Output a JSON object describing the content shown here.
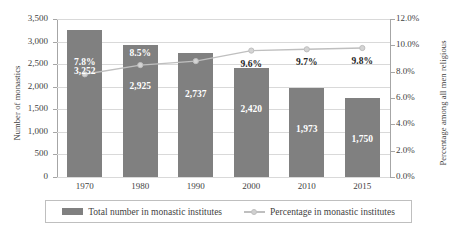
{
  "chart_data": {
    "type": "bar",
    "title": "",
    "subtitle": "",
    "categories": [
      "1970",
      "1980",
      "1990",
      "2000",
      "2010",
      "2015"
    ],
    "xlabel": "",
    "series": [
      {
        "name": "Total number in monastic institutes",
        "type": "bar",
        "axis": "left",
        "values": [
          3252,
          2925,
          2737,
          2420,
          1973,
          1750
        ],
        "labels": [
          "3,252",
          "2,925",
          "2,737",
          "2,420",
          "1,973",
          "1,750"
        ],
        "color": "#808080"
      },
      {
        "name": "Percentage in monastic institutes",
        "type": "line",
        "axis": "right",
        "values": [
          7.8,
          8.5,
          8.8,
          9.6,
          9.7,
          9.8
        ],
        "labels": [
          "7.8%",
          "8.5%",
          "8.8%",
          "9.6%",
          "9.7%",
          "9.8%"
        ],
        "color": "#bfbfbf",
        "marker": "circle"
      }
    ],
    "left_axis": {
      "label": "Number of monastics",
      "ylim": [
        0,
        3500
      ],
      "ticks": [
        0,
        500,
        1000,
        1500,
        2000,
        2500,
        3000,
        3500
      ],
      "ticklabels": [
        "0",
        "500",
        "1,000",
        "1,500",
        "2,000",
        "2,500",
        "3,000",
        "3,500"
      ]
    },
    "right_axis": {
      "label": "Percentage among all men religious",
      "ylim": [
        0,
        12
      ],
      "ticks": [
        0,
        2,
        4,
        6,
        8,
        10,
        12
      ],
      "ticklabels": [
        "0.0%",
        "2.0%",
        "4.0%",
        "6.0%",
        "8.0%",
        "10.0%",
        "12.0%"
      ]
    },
    "grid": true,
    "legend_position": "bottom"
  },
  "legend": {
    "entries": [
      {
        "label": "Total number in monastic institutes"
      },
      {
        "label": "Percentage in monastic institutes"
      }
    ]
  },
  "colors": {
    "bar": "#808080",
    "line": "#bfbfbf",
    "grid": "#d9d9d9",
    "axis": "#a6a6a6",
    "text": "#3f3f3f"
  }
}
